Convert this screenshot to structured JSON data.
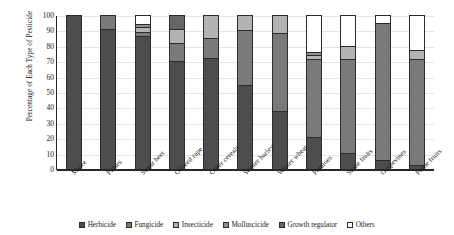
{
  "chart_data": {
    "type": "bar",
    "subtype": "stacked-bar-100-percent",
    "title": "",
    "xlabel": "",
    "ylabel": "Percentage of Each Type of Pesticide",
    "ylim": [
      0,
      100
    ],
    "yticks": [
      0,
      10,
      20,
      30,
      40,
      50,
      60,
      70,
      80,
      90,
      100
    ],
    "grid": true,
    "legend_position": "bottom",
    "categories": [
      "Maize",
      "Pulses",
      "Sugar beet",
      "Oilseed rape",
      "Other cereals",
      "Winter barley",
      "Winter wheat",
      "Potatoes",
      "Stone fruits",
      "Grapevines",
      "Pome fruits"
    ],
    "series": [
      {
        "name": "Herbicide",
        "color": "#4d4d4d",
        "values": [
          100,
          91,
          86,
          70,
          72,
          54,
          37,
          20,
          10,
          5,
          2
        ]
      },
      {
        "name": "Fungicide",
        "color": "#7a7a7a",
        "values": [
          0,
          9,
          3,
          12,
          13,
          36,
          51,
          51,
          61,
          90,
          69
        ]
      },
      {
        "name": "Insecticide",
        "color": "#b3b3b3",
        "values": [
          0,
          0,
          3,
          9,
          15,
          10,
          12,
          3,
          9,
          0,
          6
        ]
      },
      {
        "name": "Molluscicide",
        "color": "#8f8f8f",
        "values": [
          0,
          0,
          2,
          0,
          0,
          0,
          0,
          2,
          0,
          0,
          0
        ]
      },
      {
        "name": "Growth regulator",
        "color": "#666666",
        "values": [
          0,
          0,
          0,
          9,
          0,
          0,
          0,
          0,
          0,
          0,
          0
        ]
      },
      {
        "name": "Others",
        "color": "#ffffff",
        "values": [
          0,
          0,
          6,
          0,
          0,
          0,
          0,
          24,
          20,
          5,
          23
        ]
      }
    ]
  }
}
